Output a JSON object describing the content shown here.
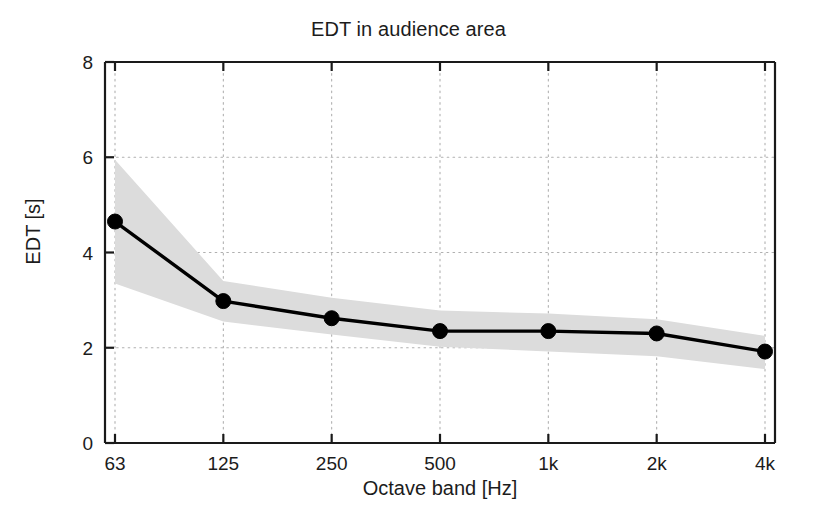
{
  "chart_data": {
    "type": "line",
    "title": "EDT in audience area",
    "xlabel": "Octave band [Hz]",
    "ylabel": "EDT [s]",
    "categories": [
      "63",
      "125",
      "250",
      "500",
      "1k",
      "2k",
      "4k"
    ],
    "values": [
      4.65,
      2.98,
      2.62,
      2.35,
      2.35,
      2.3,
      1.92
    ],
    "series": [
      {
        "name": "EDT mean",
        "values": [
          4.65,
          2.98,
          2.62,
          2.35,
          2.35,
          2.3,
          1.92
        ]
      },
      {
        "name": "Upper bound (shaded band)",
        "values": [
          5.95,
          3.4,
          3.05,
          2.78,
          2.72,
          2.6,
          2.25
        ]
      },
      {
        "name": "Lower bound (shaded band)",
        "values": [
          3.35,
          2.55,
          2.28,
          2.02,
          1.92,
          1.82,
          1.55
        ]
      }
    ],
    "ylim": [
      0,
      8
    ],
    "yticks": [
      0,
      2,
      4,
      6,
      8
    ],
    "ytick_labels": [
      "0",
      "2",
      "4",
      "6",
      "8"
    ],
    "grid": true,
    "grid_style": "dotted",
    "legend": "none",
    "band_color": "#dcdcdc",
    "line_color": "#000000",
    "marker": "circle",
    "marker_color": "#000000"
  },
  "figure": {
    "background_color": "#ffffff",
    "axis_color": "#1a1a1a",
    "grid_color": "#b4b4b4"
  }
}
